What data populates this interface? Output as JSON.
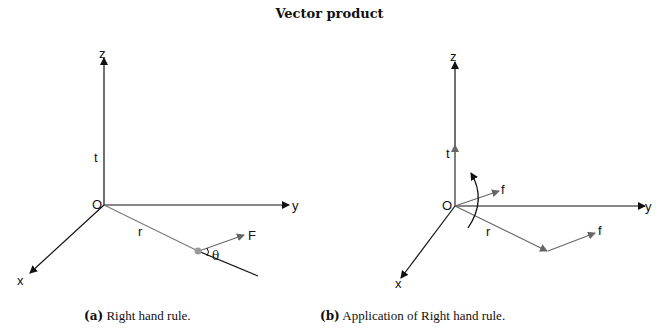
{
  "title": "Vector product",
  "panels": [
    {
      "id": "a",
      "caption_tag": "(a)",
      "caption_text": "Right hand rule.",
      "labels": {
        "z": "z",
        "y": "y",
        "x": "x",
        "origin": "O",
        "t": "t",
        "r": "r",
        "force": "F",
        "angle": "θ"
      }
    },
    {
      "id": "b",
      "caption_tag": "(b)",
      "caption_text": "Application of Right hand rule.",
      "labels": {
        "z": "z",
        "y": "y",
        "x": "x",
        "origin": "O",
        "t": "t",
        "r": "r",
        "force_origin": "f",
        "force_end": "f"
      }
    }
  ],
  "colors": {
    "axis": "#111111",
    "vector": "#666666",
    "text": "#111111"
  }
}
